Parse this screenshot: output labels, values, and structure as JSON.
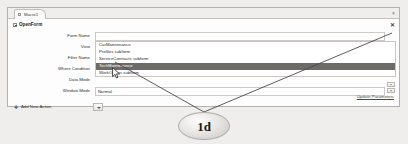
{
  "window": {
    "tab_label": "Macro1",
    "tab_close_icon": "close-icon",
    "panel_close_icon": "close-icon"
  },
  "action_block": {
    "title": "OpenForm",
    "expander_icon": "collapse-minus-icon",
    "close_icon": "close-icon"
  },
  "arguments": [
    {
      "label": "Form Name",
      "value": ""
    },
    {
      "label": "View",
      "value": ""
    },
    {
      "label": "Filter Name",
      "value": ""
    },
    {
      "label": "Where Condition",
      "value": ""
    },
    {
      "label": "Data Mode",
      "value": ""
    },
    {
      "label": "Window Mode",
      "value": "Normal"
    }
  ],
  "dropdown": {
    "open": true,
    "selected_index": 3,
    "items": [
      "CarMaintenance",
      "Profiles subform",
      "ServiceContracts subform",
      "TechMaintenance",
      "WorkOrders subform"
    ]
  },
  "footer": {
    "update_parameters_label": "Update Parameters",
    "add_new_action_label": "Add New Action",
    "add_plus_icon": "plus-icon",
    "add_action_dropdown_icon": "chevron-down-icon"
  },
  "annotation": {
    "label": "1d",
    "leader_lines": 2
  },
  "colors": {
    "selection": "#6d6b68",
    "panel_border": "#b3b0ad",
    "page_background": "#f0eeec"
  }
}
